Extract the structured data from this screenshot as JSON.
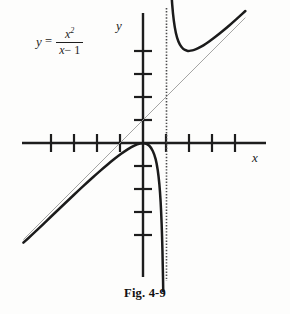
{
  "figure": {
    "caption": "Fig. 4-9",
    "equation": {
      "lhs": "y",
      "equals": "=",
      "numerator": "x",
      "numerator_exponent": "2",
      "denominator_var": "x",
      "denominator_rest": "− 1"
    },
    "axis_labels": {
      "x": "x",
      "y": "y"
    },
    "colors": {
      "background": "#fdfdfc",
      "curve": "#1b1b1b",
      "axis": "#1d1d1d",
      "asymptote_slant": "#8f8f8f",
      "asymptote_vertical": "#4a4a4a",
      "caption_text": "#111111"
    }
  },
  "chart_data": {
    "type": "line",
    "title": "Fig. 4-9",
    "function": "y = x^2/(x - 1)",
    "xlabel": "x",
    "ylabel": "y",
    "grid": false,
    "legend": "none",
    "xlim": [
      -5.2,
      4.6
    ],
    "ylim": [
      -5.8,
      6.0
    ],
    "x_ticks": [
      -4,
      -3,
      -2,
      -1,
      1,
      2,
      3,
      4
    ],
    "y_ticks": [
      -4,
      -3,
      -2,
      -1,
      1,
      2,
      3,
      4
    ],
    "origin_px": [
      143,
      143
    ],
    "unit_px": [
      23,
      23
    ],
    "annotations": [
      {
        "name": "vertical-asymptote",
        "type": "vertical-line",
        "x": 1,
        "style": "dotted"
      },
      {
        "name": "slant-asymptote",
        "type": "line",
        "slope": 1,
        "intercept": 1,
        "style": "thin-solid"
      },
      {
        "name": "local-minimum",
        "x": 2,
        "y": 4
      },
      {
        "name": "origin-point",
        "x": 0,
        "y": 0
      }
    ],
    "series": [
      {
        "name": "left-branch",
        "comment": "x < 1 branch of y = x^2/(x-1), passes through origin, falls to -inf at x=1",
        "points": [
          [
            -5.2,
            -4.33
          ],
          [
            -4.8,
            -3.97
          ],
          [
            -4.4,
            -3.59
          ],
          [
            -4.0,
            -3.2
          ],
          [
            -3.6,
            -2.82
          ],
          [
            -3.2,
            -2.44
          ],
          [
            -2.8,
            -2.06
          ],
          [
            -2.4,
            -1.69
          ],
          [
            -2.0,
            -1.33
          ],
          [
            -1.7,
            -1.07
          ],
          [
            -1.4,
            -0.82
          ],
          [
            -1.1,
            -0.58
          ],
          [
            -0.8,
            -0.36
          ],
          [
            -0.5,
            -0.17
          ],
          [
            -0.25,
            -0.05
          ],
          [
            0.0,
            0.0
          ],
          [
            0.2,
            -0.05
          ],
          [
            0.35,
            -0.19
          ],
          [
            0.5,
            -0.5
          ],
          [
            0.6,
            -0.9
          ],
          [
            0.68,
            -1.45
          ],
          [
            0.74,
            -2.11
          ],
          [
            0.79,
            -2.97
          ],
          [
            0.83,
            -4.05
          ],
          [
            0.86,
            -5.28
          ],
          [
            0.88,
            -6.45
          ]
        ]
      },
      {
        "name": "right-branch",
        "comment": "x > 1 branch, vertical asymptote at x=1, minimum at (2,4)",
        "points": [
          [
            1.13,
            9.78
          ],
          [
            1.18,
            7.74
          ],
          [
            1.24,
            6.41
          ],
          [
            1.3,
            5.63
          ],
          [
            1.38,
            5.01
          ],
          [
            1.48,
            4.56
          ],
          [
            1.6,
            4.27
          ],
          [
            1.75,
            4.08
          ],
          [
            1.9,
            4.01
          ],
          [
            2.0,
            4.0
          ],
          [
            2.15,
            4.03
          ],
          [
            2.3,
            4.07
          ],
          [
            2.5,
            4.17
          ],
          [
            2.75,
            4.32
          ],
          [
            3.0,
            4.5
          ],
          [
            3.3,
            4.73
          ],
          [
            3.6,
            4.98
          ],
          [
            3.9,
            5.24
          ],
          [
            4.2,
            5.51
          ],
          [
            4.45,
            5.74
          ]
        ]
      },
      {
        "name": "slant-asymptote-line",
        "comment": "y = x + 1",
        "points": [
          [
            -5.2,
            -4.2
          ],
          [
            4.45,
            5.45
          ]
        ]
      }
    ]
  }
}
